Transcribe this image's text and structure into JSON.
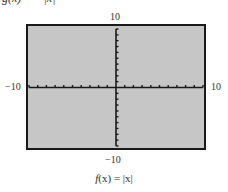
{
  "chart_data": {
    "type": "line",
    "title": "",
    "caption": "f(x) = |x|",
    "function": "f(x) = |x|",
    "series": [],
    "xlabel": "",
    "ylabel": "",
    "xlim": [
      -10,
      10
    ],
    "ylim": [
      -10,
      10
    ],
    "xscale": 1,
    "yscale": 1,
    "x_tick_labels": {
      "min": "−10",
      "max": "10"
    },
    "y_tick_labels": {
      "min": "−10",
      "max": "10"
    },
    "grid": false,
    "legend": null,
    "axes_only": true,
    "background": "#c6c6c6",
    "frame_color": "#1a1a1a"
  },
  "labels": {
    "ymax": "10",
    "ymin": "−10",
    "xmin": "−10",
    "xmax": "10"
  },
  "caption": {
    "name": "f",
    "arg": "(x)",
    "eq": " = ",
    "body": "|x|"
  },
  "cropped_top_caption": "g(x) = −|x|"
}
